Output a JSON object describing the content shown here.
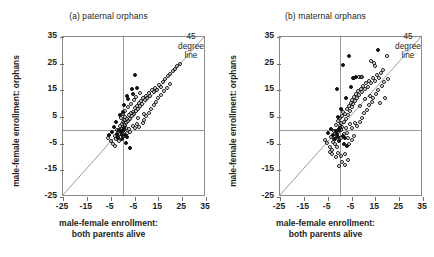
{
  "figure": {
    "axis_labels": {
      "y": "male-female enrollment: orphans",
      "x_line1": "male-female enrollment:",
      "x_line2": "both parents alive"
    },
    "annotation": {
      "line1": "45",
      "line2": "degree",
      "line3": "line"
    },
    "colors": {
      "point_stroke": "#1a1a1a",
      "point_fill_solid": "#111111",
      "reference_line": "#9a9a9a",
      "frame": "#8a8a8a",
      "text": "#231f20"
    }
  },
  "chart_data": [
    {
      "type": "scatter",
      "panel_id": "a",
      "title": "(a) paternal orphans",
      "xlabel": "male-female enrollment: both parents alive",
      "ylabel": "male-female enrollment: orphans",
      "xlim": [
        -25,
        35
      ],
      "ylim": [
        -25,
        35
      ],
      "xticks": [
        -25,
        -15,
        -5,
        5,
        15,
        25,
        35
      ],
      "yticks": [
        -25,
        -15,
        -5,
        5,
        15,
        25,
        35
      ],
      "xticklabels": [
        "-25",
        "-15",
        "-5",
        "-5",
        "15",
        "25",
        "35"
      ],
      "yticklabels": [
        "-25",
        "-15",
        "-5",
        "5",
        "15",
        "25",
        "35"
      ],
      "grid": false,
      "legend": false,
      "reference_lines": [
        {
          "name": "45-degree-line",
          "type": "identity",
          "from": [
            -25,
            -25
          ],
          "to": [
            35,
            35
          ],
          "label": "45 degree line"
        },
        {
          "name": "x-zero-line",
          "type": "vertical",
          "value": 0
        },
        {
          "name": "y-zero-line",
          "type": "horizontal",
          "value": 0
        }
      ],
      "series": [
        {
          "name": "open-markers",
          "marker": "open-circle",
          "points": [
            [
              -1.0,
              -1.5
            ],
            [
              -0.6,
              -0.4
            ],
            [
              -0.2,
              0.6
            ],
            [
              0.2,
              1.2
            ],
            [
              0.6,
              0.2
            ],
            [
              1.0,
              2.0
            ],
            [
              1.4,
              1.0
            ],
            [
              -0.4,
              2.4
            ],
            [
              0.0,
              3.2
            ],
            [
              0.8,
              3.8
            ],
            [
              1.6,
              2.8
            ],
            [
              2.0,
              4.4
            ],
            [
              2.4,
              3.4
            ],
            [
              1.2,
              5.0
            ],
            [
              2.8,
              5.6
            ],
            [
              3.2,
              4.2
            ],
            [
              3.6,
              6.4
            ],
            [
              4.0,
              5.2
            ],
            [
              4.4,
              7.0
            ],
            [
              4.8,
              6.0
            ],
            [
              5.2,
              8.2
            ],
            [
              5.6,
              7.2
            ],
            [
              6.0,
              9.0
            ],
            [
              6.4,
              8.0
            ],
            [
              6.8,
              10.2
            ],
            [
              7.2,
              9.2
            ],
            [
              7.6,
              11.0
            ],
            [
              8.0,
              10.0
            ],
            [
              8.6,
              12.0
            ],
            [
              9.2,
              11.2
            ],
            [
              9.8,
              13.0
            ],
            [
              10.4,
              12.2
            ],
            [
              11.0,
              14.0
            ],
            [
              11.6,
              13.0
            ],
            [
              12.2,
              15.0
            ],
            [
              13.0,
              14.2
            ],
            [
              13.8,
              16.0
            ],
            [
              14.6,
              15.0
            ],
            [
              15.4,
              17.0
            ],
            [
              16.2,
              16.2
            ],
            [
              17.0,
              18.0
            ],
            [
              18.0,
              19.2
            ],
            [
              19.0,
              20.4
            ],
            [
              20.0,
              21.0
            ],
            [
              21.0,
              22.4
            ],
            [
              22.0,
              23.0
            ],
            [
              23.0,
              24.2
            ],
            [
              24.0,
              25.0
            ],
            [
              -2.0,
              -2.6
            ],
            [
              -2.6,
              -3.4
            ],
            [
              -3.2,
              -2.0
            ],
            [
              -1.6,
              -4.0
            ],
            [
              -4.0,
              -5.2
            ],
            [
              -5.0,
              -4.0
            ],
            [
              -3.0,
              -6.0
            ],
            [
              -6.0,
              -3.0
            ],
            [
              -2.2,
              0.0
            ],
            [
              -1.2,
              1.6
            ],
            [
              0.4,
              -2.2
            ],
            [
              1.8,
              -1.0
            ],
            [
              2.6,
              0.4
            ],
            [
              3.0,
              -0.6
            ],
            [
              4.2,
              1.8
            ],
            [
              5.0,
              0.8
            ],
            [
              6.2,
              2.2
            ],
            [
              7.0,
              1.4
            ],
            [
              8.4,
              2.6
            ],
            [
              9.0,
              4.0
            ],
            [
              10.0,
              5.4
            ],
            [
              11.2,
              6.6
            ],
            [
              12.0,
              8.0
            ],
            [
              13.2,
              9.4
            ],
            [
              14.0,
              10.6
            ],
            [
              15.0,
              12.0
            ],
            [
              16.0,
              13.4
            ],
            [
              17.4,
              14.6
            ],
            [
              18.6,
              16.0
            ],
            [
              19.8,
              17.2
            ],
            [
              2.2,
              8.6
            ],
            [
              3.4,
              10.0
            ],
            [
              4.6,
              11.4
            ],
            [
              5.8,
              12.6
            ],
            [
              7.4,
              14.0
            ],
            [
              1.0,
              7.4
            ],
            [
              0.2,
              6.2
            ],
            [
              -0.8,
              4.8
            ],
            [
              6.6,
              4.8
            ],
            [
              8.8,
              6.0
            ]
          ]
        },
        {
          "name": "solid-markers",
          "marker": "filled-circle",
          "points": [
            [
              -0.8,
              -0.8
            ],
            [
              -0.4,
              -1.8
            ],
            [
              0.0,
              -0.2
            ],
            [
              0.4,
              0.8
            ],
            [
              -1.4,
              0.2
            ],
            [
              -2.4,
              -1.2
            ],
            [
              -1.8,
              -2.8
            ],
            [
              -0.2,
              -3.2
            ],
            [
              1.2,
              -1.6
            ],
            [
              2.0,
              -2.4
            ],
            [
              -3.4,
              1.4
            ],
            [
              -2.8,
              3.0
            ],
            [
              -1.0,
              5.6
            ],
            [
              0.6,
              9.4
            ],
            [
              1.8,
              13.0
            ],
            [
              3.8,
              15.6
            ],
            [
              5.4,
              20.8
            ],
            [
              2.4,
              11.6
            ],
            [
              4.4,
              13.6
            ],
            [
              0.2,
              7.0
            ],
            [
              3.0,
              -6.8
            ],
            [
              1.6,
              -4.6
            ],
            [
              -4.6,
              -0.6
            ],
            [
              -5.6,
              -1.6
            ],
            [
              6.0,
              16.0
            ]
          ]
        }
      ]
    },
    {
      "type": "scatter",
      "panel_id": "b",
      "title": "(b) maternal orphans",
      "xlabel": "male-female enrollment: both parents alive",
      "ylabel": "male-female enrollment: orphans",
      "xlim": [
        -25,
        35
      ],
      "ylim": [
        -25,
        35
      ],
      "xticks": [
        -25,
        -15,
        -5,
        5,
        15,
        25,
        35
      ],
      "yticks": [
        -25,
        -15,
        -5,
        5,
        15,
        25,
        35
      ],
      "xticklabels": [
        "-25",
        "-15",
        "-5",
        "-5",
        "15",
        "25",
        "35"
      ],
      "yticklabels": [
        "-25",
        "-15",
        "-5",
        "5",
        "15",
        "25",
        "35"
      ],
      "grid": false,
      "legend": false,
      "reference_lines": [
        {
          "name": "45-degree-line",
          "type": "identity",
          "from": [
            -25,
            -25
          ],
          "to": [
            35,
            35
          ],
          "label": "45 degree line"
        },
        {
          "name": "x-zero-line",
          "type": "vertical",
          "value": 0
        },
        {
          "name": "y-zero-line",
          "type": "horizontal",
          "value": 0
        }
      ],
      "series": [
        {
          "name": "open-markers",
          "marker": "open-circle",
          "points": [
            [
              -1.2,
              -2.0
            ],
            [
              -0.8,
              -0.8
            ],
            [
              -0.4,
              0.4
            ],
            [
              0.0,
              1.6
            ],
            [
              0.4,
              0.0
            ],
            [
              0.8,
              2.6
            ],
            [
              1.2,
              1.2
            ],
            [
              -0.6,
              3.4
            ],
            [
              0.2,
              4.6
            ],
            [
              1.0,
              5.4
            ],
            [
              1.8,
              3.0
            ],
            [
              2.2,
              6.2
            ],
            [
              2.6,
              4.4
            ],
            [
              1.4,
              7.0
            ],
            [
              3.0,
              8.0
            ],
            [
              3.4,
              5.6
            ],
            [
              3.8,
              9.0
            ],
            [
              4.2,
              7.4
            ],
            [
              4.6,
              10.2
            ],
            [
              5.0,
              8.6
            ],
            [
              5.4,
              11.4
            ],
            [
              5.8,
              9.8
            ],
            [
              6.2,
              12.4
            ],
            [
              6.6,
              11.0
            ],
            [
              7.0,
              13.6
            ],
            [
              7.4,
              12.2
            ],
            [
              7.8,
              14.6
            ],
            [
              8.2,
              13.2
            ],
            [
              8.8,
              15.6
            ],
            [
              9.4,
              14.4
            ],
            [
              10.0,
              16.6
            ],
            [
              10.6,
              15.4
            ],
            [
              11.2,
              17.6
            ],
            [
              11.8,
              16.4
            ],
            [
              12.4,
              18.6
            ],
            [
              13.2,
              17.6
            ],
            [
              14.0,
              19.6
            ],
            [
              14.8,
              18.4
            ],
            [
              15.6,
              20.6
            ],
            [
              16.4,
              19.6
            ],
            [
              17.2,
              21.6
            ],
            [
              18.2,
              22.6
            ],
            [
              13.0,
              26.0
            ],
            [
              14.4,
              25.2
            ],
            [
              14.8,
              24.0
            ],
            [
              20.0,
              27.8
            ],
            [
              8.0,
              20.0
            ],
            [
              9.0,
              20.0
            ],
            [
              9.6,
              20.0
            ],
            [
              -2.2,
              -3.2
            ],
            [
              -2.8,
              -4.2
            ],
            [
              -3.4,
              -2.4
            ],
            [
              -1.8,
              -5.0
            ],
            [
              -4.2,
              -6.2
            ],
            [
              -5.2,
              -4.8
            ],
            [
              -3.2,
              -7.2
            ],
            [
              -6.2,
              -3.6
            ],
            [
              -2.4,
              -0.4
            ],
            [
              -1.4,
              2.0
            ],
            [
              0.6,
              -3.0
            ],
            [
              2.0,
              -1.4
            ],
            [
              2.8,
              0.8
            ],
            [
              3.2,
              -1.0
            ],
            [
              4.4,
              2.2
            ],
            [
              5.2,
              1.0
            ],
            [
              6.4,
              2.8
            ],
            [
              7.2,
              1.8
            ],
            [
              8.6,
              3.2
            ],
            [
              9.2,
              4.8
            ],
            [
              10.2,
              6.4
            ],
            [
              11.4,
              7.8
            ],
            [
              12.2,
              9.4
            ],
            [
              13.4,
              10.8
            ],
            [
              14.2,
              12.2
            ],
            [
              15.2,
              13.8
            ],
            [
              16.2,
              15.2
            ],
            [
              17.6,
              16.6
            ],
            [
              18.8,
              18.0
            ],
            [
              20.2,
              19.4
            ],
            [
              -3.0,
              -9.0
            ],
            [
              -1.6,
              -10.0
            ],
            [
              -0.6,
              -8.4
            ],
            [
              0.8,
              -9.6
            ],
            [
              2.2,
              -8.8
            ],
            [
              1.0,
              -12.0
            ],
            [
              -0.2,
              -13.4
            ],
            [
              2.4,
              -13.0
            ],
            [
              3.4,
              -11.0
            ],
            [
              -4.0,
              -8.0
            ],
            [
              4.0,
              -5.0
            ],
            [
              5.0,
              -3.6
            ],
            [
              6.0,
              -2.2
            ],
            [
              3.6,
              -3.0
            ],
            [
              -1.0,
              -6.4
            ],
            [
              19.0,
              12.0
            ],
            [
              16.8,
              10.4
            ],
            [
              12.6,
              13.0
            ],
            [
              10.8,
              11.6
            ],
            [
              8.4,
              9.0
            ]
          ]
        },
        {
          "name": "solid-markers",
          "marker": "filled-circle",
          "points": [
            [
              -1.0,
              -1.2
            ],
            [
              -0.6,
              -2.4
            ],
            [
              -0.2,
              0.2
            ],
            [
              0.2,
              1.0
            ],
            [
              -1.6,
              -0.2
            ],
            [
              -2.6,
              -1.6
            ],
            [
              -2.0,
              -3.4
            ],
            [
              -0.4,
              -4.0
            ],
            [
              1.4,
              -2.0
            ],
            [
              2.2,
              -3.0
            ],
            [
              -3.6,
              0.6
            ],
            [
              -1.2,
              15.4
            ],
            [
              1.6,
              24.4
            ],
            [
              4.0,
              28.0
            ],
            [
              16.0,
              30.0
            ],
            [
              5.6,
              19.8
            ],
            [
              6.2,
              19.8
            ],
            [
              2.8,
              12.0
            ],
            [
              0.6,
              8.0
            ],
            [
              4.8,
              16.2
            ],
            [
              3.2,
              -6.0
            ],
            [
              1.8,
              -5.2
            ],
            [
              -4.8,
              -1.0
            ],
            [
              -0.8,
              5.0
            ],
            [
              7.0,
              20.0
            ]
          ]
        }
      ]
    }
  ]
}
